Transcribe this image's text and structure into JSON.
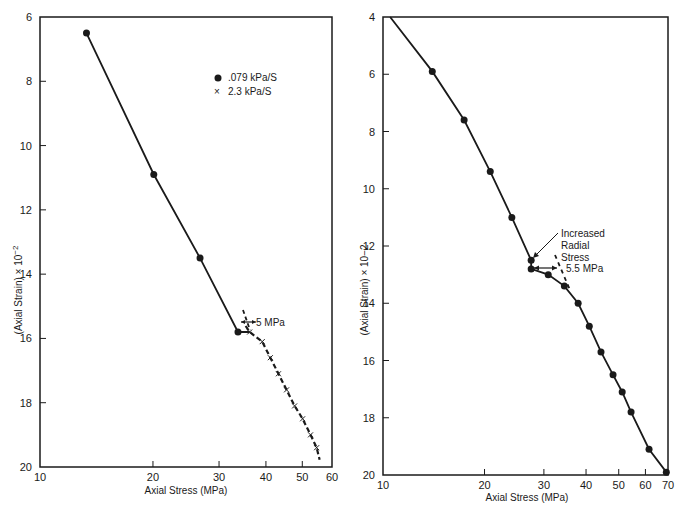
{
  "chart_data": [
    {
      "type": "line",
      "title": "",
      "xlabel": "Axial Stress (MPa)",
      "ylabel": "(Axial Strain) x 10^-2",
      "ylabel_text": "(Axial Strain) × 10",
      "ylabel_exp": "−2",
      "x_scale": "log",
      "xlim": [
        10,
        60
      ],
      "ylim": [
        20,
        6
      ],
      "y_inverted": true,
      "grid": false,
      "x_ticks": [
        10,
        20,
        30,
        40,
        50,
        60
      ],
      "y_ticks": [
        6,
        8,
        10,
        12,
        14,
        16,
        18,
        20
      ],
      "legend": {
        "position": "upper-right",
        "entries": [
          {
            "marker": "dot",
            "label": ".079 kPa/S"
          },
          {
            "marker": "x",
            "label": "2.3 kPa/S"
          }
        ]
      },
      "series": [
        {
          "name": ".079 kPa/S",
          "marker": "dot",
          "line": "solid",
          "x": [
            13.3,
            20.1,
            26.7,
            33.7
          ],
          "y": [
            6.5,
            10.9,
            13.5,
            15.8
          ]
        },
        {
          "name": "2.3 kPa/S",
          "marker": "x",
          "line": "dashed",
          "x": [
            36.2,
            39.1,
            41.1,
            43.2,
            45.4,
            47.7,
            50.1,
            52.6,
            54.6
          ],
          "y": [
            15.8,
            16.1,
            16.6,
            17.1,
            17.6,
            18.1,
            18.5,
            19.0,
            19.4
          ]
        }
      ],
      "annotations": [
        {
          "text": "5 MPa",
          "x": 36.5,
          "y": 15.5,
          "type": "double-arrow"
        }
      ]
    },
    {
      "type": "line",
      "title": "",
      "xlabel": "Axial Stress (MPa)",
      "ylabel": "(Axial Strain) x 10-2",
      "ylabel_text": "(Axial Strain) × 10−2",
      "x_scale": "log",
      "xlim": [
        10,
        70
      ],
      "ylim": [
        20,
        4
      ],
      "y_inverted": true,
      "grid": false,
      "x_ticks": [
        10,
        20,
        30,
        40,
        50,
        60,
        70
      ],
      "y_ticks": [
        4,
        6,
        8,
        10,
        12,
        14,
        16,
        18,
        20
      ],
      "series": [
        {
          "name": "data",
          "marker": "dot",
          "line": "solid",
          "x": [
            10.5,
            14.0,
            17.4,
            20.8,
            24.1,
            27.5,
            27.5,
            30.9,
            34.5,
            37.9,
            40.9,
            44.3,
            48.1,
            51.2,
            54.4,
            61.5,
            69.2
          ],
          "y": [
            4.0,
            5.9,
            7.6,
            9.4,
            11.0,
            12.5,
            12.8,
            13.0,
            13.4,
            14.0,
            14.8,
            15.7,
            16.5,
            17.1,
            17.8,
            19.1,
            19.9
          ]
        }
      ],
      "annotations": [
        {
          "text": "Increased Radial Stress",
          "lines": [
            "Increased",
            "Radial",
            "Stress"
          ],
          "type": "arrow",
          "x": 27.5,
          "y": 12.5
        },
        {
          "text": "5.5 MPa",
          "type": "double-arrow",
          "x": 31,
          "y": 12.8
        }
      ]
    }
  ]
}
